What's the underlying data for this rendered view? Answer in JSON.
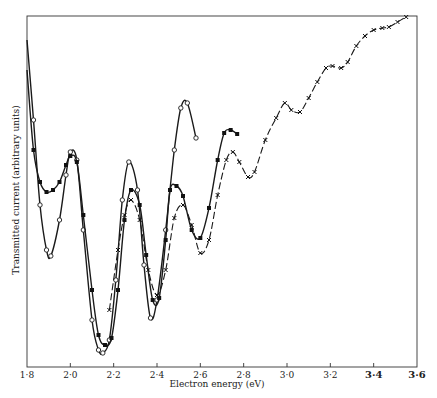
{
  "chart_data": {
    "type": "line",
    "title": "",
    "xlabel": "Electron energy (eV)",
    "ylabel": "Transmitted current (arbitrary units)",
    "xlim": [
      1.8,
      3.6
    ],
    "x_ticks": [
      "1·8",
      "2·0",
      "2·2",
      "2·4",
      "2·6",
      "2·8",
      "3·0",
      "3·2",
      "3·4",
      "3·6"
    ],
    "grid": false,
    "legend": null,
    "series": [
      {
        "name": "open-circles",
        "marker": "open-circle",
        "x": [
          1.8,
          1.83,
          1.86,
          1.89,
          1.91,
          1.95,
          1.98,
          2.0,
          2.03,
          2.06,
          2.1,
          2.13,
          2.15,
          2.18,
          2.21,
          2.24,
          2.27,
          2.31,
          2.34,
          2.37,
          2.4,
          2.44,
          2.48,
          2.51,
          2.54,
          2.58
        ],
        "y_px": [
          40,
          120,
          205,
          250,
          256,
          220,
          175,
          152,
          160,
          230,
          320,
          350,
          353,
          340,
          280,
          200,
          162,
          190,
          265,
          318,
          300,
          230,
          150,
          108,
          103,
          138
        ]
      },
      {
        "name": "filled-squares",
        "marker": "filled-square",
        "x": [
          1.8,
          1.83,
          1.86,
          1.89,
          1.92,
          1.95,
          1.98,
          2.0,
          2.03,
          2.06,
          2.1,
          2.13,
          2.16,
          2.19,
          2.22,
          2.25,
          2.28,
          2.32,
          2.35,
          2.38,
          2.41,
          2.44,
          2.46,
          2.49,
          2.52,
          2.56,
          2.6,
          2.64,
          2.68,
          2.71,
          2.74,
          2.77
        ],
        "y_px": [
          70,
          150,
          182,
          192,
          190,
          182,
          165,
          156,
          162,
          215,
          290,
          335,
          345,
          338,
          290,
          220,
          190,
          205,
          255,
          300,
          298,
          240,
          190,
          186,
          196,
          230,
          238,
          208,
          160,
          133,
          130,
          134
        ]
      },
      {
        "name": "crosses",
        "marker": "cross",
        "x": [
          2.18,
          2.22,
          2.25,
          2.28,
          2.32,
          2.36,
          2.4,
          2.44,
          2.48,
          2.52,
          2.56,
          2.6,
          2.64,
          2.68,
          2.72,
          2.75,
          2.78,
          2.82,
          2.85,
          2.9,
          2.95,
          2.99,
          3.02,
          3.06,
          3.1,
          3.14,
          3.18,
          3.21,
          3.25,
          3.28,
          3.32,
          3.36,
          3.4,
          3.44,
          3.47,
          3.51,
          3.55
        ],
        "y_px": [
          310,
          250,
          215,
          200,
          220,
          270,
          295,
          270,
          218,
          205,
          225,
          253,
          240,
          195,
          160,
          152,
          162,
          177,
          172,
          140,
          118,
          103,
          110,
          112,
          98,
          82,
          68,
          66,
          68,
          62,
          46,
          36,
          30,
          28,
          27,
          22,
          17
        ]
      }
    ]
  }
}
